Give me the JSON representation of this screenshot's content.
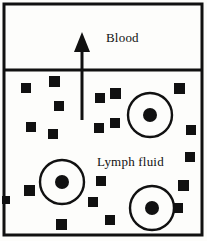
{
  "figure": {
    "type": "biology-diagram",
    "width": 207,
    "height": 241,
    "background_color": "#fdfdfb",
    "stroke_color": "#111111",
    "fill_color": "#111111"
  },
  "frame": {
    "name": "outer-frame",
    "x": 4,
    "y": 4,
    "width": 198,
    "height": 231,
    "stroke_width": 3
  },
  "divider": {
    "name": "region-divider",
    "x1": 4,
    "y1": 70,
    "x2": 202,
    "y2": 70,
    "stroke_width": 3
  },
  "regions": [
    {
      "id": "blood",
      "label": "Blood",
      "label_x": 106,
      "label_y": 31
    },
    {
      "id": "lymph",
      "label": "Lymph fluid",
      "label_x": 97,
      "label_y": 155
    }
  ],
  "arrow": {
    "name": "flow-arrow",
    "direction": "up",
    "shaft_x": 82,
    "shaft_top": 42,
    "shaft_bottom": 120,
    "stroke_width": 3,
    "head_tip_y": 32,
    "head_half_width": 8,
    "head_height": 20
  },
  "cells": [
    {
      "cx": 150,
      "cy": 115,
      "r": 22,
      "nucleus_r": 7
    },
    {
      "cx": 62,
      "cy": 182,
      "r": 22,
      "nucleus_r": 7
    },
    {
      "cx": 152,
      "cy": 208,
      "r": 22,
      "nucleus_r": 7
    }
  ],
  "cell_style": {
    "stroke_width": 2.4,
    "stroke_color": "#111111",
    "nucleus_color": "#111111"
  },
  "particles": [
    {
      "x": 21,
      "y": 83,
      "size": 10
    },
    {
      "x": 49,
      "y": 76,
      "size": 11
    },
    {
      "x": 54,
      "y": 101,
      "size": 10
    },
    {
      "x": 26,
      "y": 122,
      "size": 10
    },
    {
      "x": 48,
      "y": 129,
      "size": 10
    },
    {
      "x": 95,
      "y": 93,
      "size": 10
    },
    {
      "x": 110,
      "y": 88,
      "size": 11
    },
    {
      "x": 94,
      "y": 123,
      "size": 10
    },
    {
      "x": 110,
      "y": 118,
      "size": 10
    },
    {
      "x": 174,
      "y": 83,
      "size": 11
    },
    {
      "x": 186,
      "y": 125,
      "size": 10
    },
    {
      "x": 185,
      "y": 152,
      "size": 10
    },
    {
      "x": 24,
      "y": 185,
      "size": 11
    },
    {
      "x": 96,
      "y": 176,
      "size": 10
    },
    {
      "x": 88,
      "y": 197,
      "size": 10
    },
    {
      "x": 56,
      "y": 219,
      "size": 11
    },
    {
      "x": 105,
      "y": 215,
      "size": 10
    },
    {
      "x": 178,
      "y": 180,
      "size": 11
    },
    {
      "x": 173,
      "y": 203,
      "size": 10
    },
    {
      "x": 2,
      "y": 196,
      "size": 8
    }
  ]
}
